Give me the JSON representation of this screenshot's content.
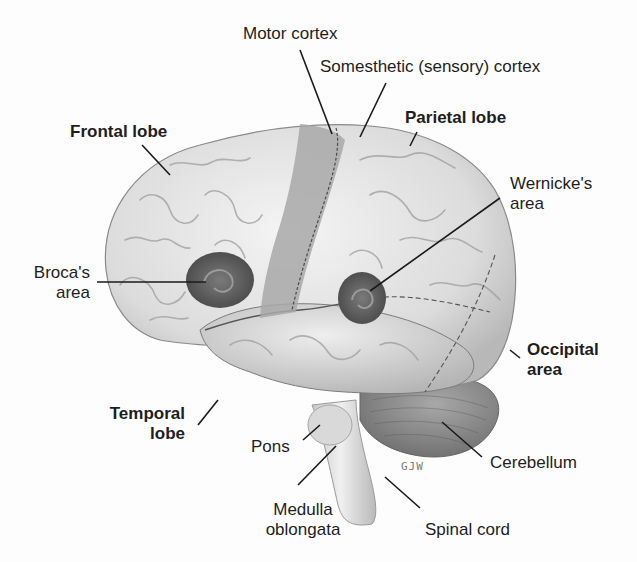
{
  "figure": {
    "signature": "GJW",
    "colors": {
      "background": "#fdfdfd",
      "cortex_light": "#e9e9e9",
      "cortex_shade": "#bdbdbd",
      "motor_sensory_strip": "#a9a9a9",
      "speech_areas": "#5a5a5a",
      "cerebellum": "#8f8f8f",
      "leader_line": "#1a1a1a"
    }
  },
  "labels": {
    "motor_cortex": "Motor cortex",
    "somesthetic_cortex": "Somesthetic (sensory) cortex",
    "frontal_lobe": "Frontal lobe",
    "parietal_lobe": "Parietal lobe",
    "wernickes_area_line1": "Wernicke's",
    "wernickes_area_line2": "area",
    "brocas_area_line1": "Broca's",
    "brocas_area_line2": "area",
    "occipital_area_line1": "Occipital",
    "occipital_area_line2": "area",
    "temporal_lobe_line1": "Temporal",
    "temporal_lobe_line2": "lobe",
    "pons": "Pons",
    "cerebellum": "Cerebellum",
    "medulla_line1": "Medulla",
    "medulla_line2": "oblongata",
    "spinal_cord": "Spinal cord"
  }
}
